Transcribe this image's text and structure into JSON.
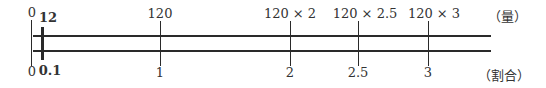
{
  "diagram": {
    "type": "double-number-line",
    "top_labels": {
      "zero": "0",
      "highlight": "12",
      "t1": "120",
      "t2": "120 × 2",
      "t25": "120 × 2.5",
      "t3": "120 × 3"
    },
    "bottom_labels": {
      "zero": "0",
      "highlight": "0.1",
      "t1": "1",
      "t2": "2",
      "t25": "2.5",
      "t3": "3"
    },
    "units": {
      "top": "（量）",
      "bottom": "（割合）"
    }
  }
}
